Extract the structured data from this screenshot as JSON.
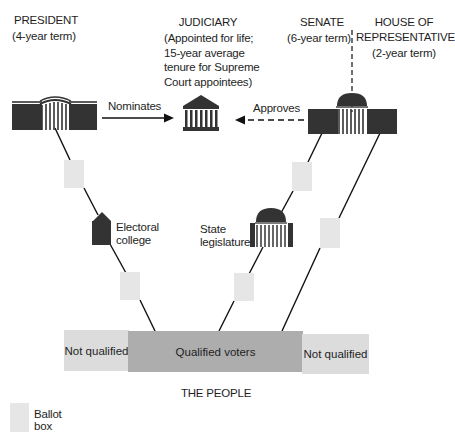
{
  "branches": {
    "president": {
      "name": "PRESIDENT",
      "term": "(4-year term)"
    },
    "judiciary": {
      "name": "JUDICIARY",
      "term_lines": [
        "(Appointed for life;",
        "15-year average",
        "tenure for Supreme",
        "Court appointees)"
      ]
    },
    "senate": {
      "name": "SENATE",
      "term": "(6-year term)"
    },
    "house": {
      "name_lines": [
        "HOUSE OF",
        "REPRESENTATIVES"
      ],
      "term": "(2-year term)"
    }
  },
  "relations": {
    "nominates": "Nominates",
    "approves": "Approves"
  },
  "intermediaries": {
    "electoral_college": [
      "Electoral",
      "college"
    ],
    "state_legislature": [
      "State",
      "legislature"
    ]
  },
  "people": {
    "segments": [
      {
        "label": "Not qualified",
        "color": "#dcdcdc"
      },
      {
        "label": "Qualified voters",
        "color": "#adadad"
      },
      {
        "label": "Not qualified",
        "color": "#dcdcdc"
      }
    ],
    "caption": "THE PEOPLE"
  },
  "legend": {
    "ballot_box": [
      "Ballot",
      "box"
    ]
  },
  "colors": {
    "building_dark": "#333333",
    "ballot_box": "#e6e6e6",
    "line": "#111111"
  }
}
